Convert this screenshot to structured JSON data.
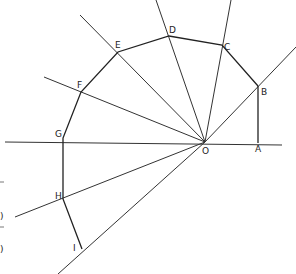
{
  "diagram": {
    "type": "geometric-construction",
    "center": {
      "label": "O",
      "x": 205,
      "y": 142
    },
    "points": [
      {
        "label": "A",
        "x": 258,
        "y": 143,
        "label_x": 255,
        "label_y": 152
      },
      {
        "label": "B",
        "x": 258,
        "y": 86,
        "label_x": 261,
        "label_y": 95
      },
      {
        "label": "C",
        "x": 222,
        "y": 45,
        "label_x": 224,
        "label_y": 50
      },
      {
        "label": "D",
        "x": 169,
        "y": 36,
        "label_x": 169,
        "label_y": 33
      },
      {
        "label": "E",
        "x": 118,
        "y": 52,
        "label_x": 115,
        "label_y": 48
      },
      {
        "label": "F",
        "x": 81,
        "y": 92,
        "label_x": 77,
        "label_y": 88
      },
      {
        "label": "G",
        "x": 63,
        "y": 138,
        "label_x": 55,
        "label_y": 137
      },
      {
        "label": "H",
        "x": 63,
        "y": 199,
        "label_x": 55,
        "label_y": 199
      },
      {
        "label": "I",
        "x": 82,
        "y": 249,
        "label_x": 73,
        "label_y": 251
      }
    ],
    "rays": [
      {
        "name": "baseline",
        "x1": 5,
        "y1": 142,
        "x2": 282,
        "y2": 145
      },
      {
        "name": "ray-OB",
        "x1": 205,
        "y1": 142,
        "x2": 296,
        "y2": 47
      },
      {
        "name": "ray-OC",
        "x1": 205,
        "y1": 142,
        "x2": 231,
        "y2": 0
      },
      {
        "name": "ray-OD",
        "x1": 205,
        "y1": 142,
        "x2": 156,
        "y2": 0
      },
      {
        "name": "ray-OE",
        "x1": 205,
        "y1": 142,
        "x2": 80,
        "y2": 15
      },
      {
        "name": "ray-OF",
        "x1": 205,
        "y1": 142,
        "x2": 44,
        "y2": 77
      },
      {
        "name": "ray-OH",
        "x1": 205,
        "y1": 142,
        "x2": 15,
        "y2": 217
      },
      {
        "name": "ray-OI",
        "x1": 205,
        "y1": 142,
        "x2": 58,
        "y2": 274
      },
      {
        "name": "segment-AB",
        "x1": 258,
        "y1": 143,
        "x2": 258,
        "y2": 86
      }
    ],
    "polygon_path": [
      "B",
      "C",
      "D",
      "E",
      "F",
      "G",
      "H",
      "I"
    ],
    "margin_marks": [
      ")",
      ")"
    ]
  }
}
